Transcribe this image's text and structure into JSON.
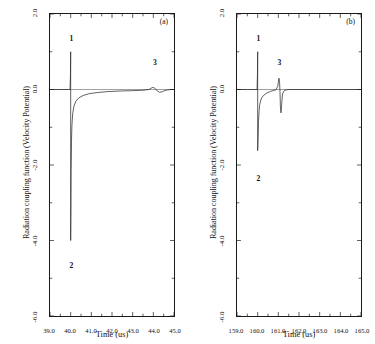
{
  "figure": {
    "ylabel": "Radiation coupling function (Velocity Potential)",
    "xlabel": "Time (us)"
  },
  "panels": [
    {
      "tag": "(a)",
      "xlabel": "Time (us)",
      "xticks": [
        "39.0",
        "40.0",
        "41.0",
        "42.0",
        "43.0",
        "44.0",
        "45.0"
      ],
      "yticks": [
        "2.0",
        "0.0",
        "-2.0",
        "-4.0",
        "-6.0"
      ],
      "annotations": [
        {
          "label": "1",
          "x": 40.02,
          "y": 1.35
        },
        {
          "label": "2",
          "x": 40.02,
          "y": -4.62
        },
        {
          "label": "3",
          "x": 44.0,
          "y": 0.72
        }
      ]
    },
    {
      "tag": "(b)",
      "xlabel": "Time (us)",
      "xticks": [
        "159.0",
        "160.0",
        "161.0",
        "162.0",
        "163.0",
        "164.0",
        "165.0"
      ],
      "yticks": [
        "2.0",
        "0.0",
        "-2.0",
        "-4.0",
        "-6.0"
      ],
      "annotations": [
        {
          "label": "1",
          "x": 160.02,
          "y": 1.35
        },
        {
          "label": "2",
          "x": 160.02,
          "y": -2.35
        },
        {
          "label": "3",
          "x": 161.02,
          "y": 0.72
        }
      ]
    }
  ],
  "chart_data": [
    {
      "type": "line",
      "title": "(a)",
      "xlabel": "Time (us)",
      "ylabel": "Radiation coupling function (Velocity Potential)",
      "xlim": [
        39.0,
        45.0
      ],
      "ylim": [
        -6.0,
        2.0
      ],
      "xticks": [
        39.0,
        40.0,
        41.0,
        42.0,
        43.0,
        44.0,
        45.0
      ],
      "yticks": [
        2.0,
        0.0,
        -2.0,
        -4.0,
        -6.0
      ],
      "grid": false,
      "legend": null,
      "series": [
        {
          "name": "radiation coupling function (a)",
          "x": [
            39.0,
            39.5,
            39.9,
            39.97,
            39.99,
            40.0,
            40.0,
            40.01,
            40.02,
            40.04,
            40.06,
            40.1,
            40.16,
            40.25,
            40.4,
            40.6,
            40.9,
            41.3,
            41.8,
            42.4,
            43.0,
            43.5,
            43.8,
            43.95,
            44.05,
            44.15,
            44.3,
            44.45,
            44.55,
            44.7,
            44.85,
            45.0
          ],
          "y": [
            0.0,
            0.0,
            0.0,
            0.0,
            0.4,
            1.0,
            -4.0,
            -3.4,
            -2.2,
            -1.35,
            -0.95,
            -0.63,
            -0.44,
            -0.31,
            -0.22,
            -0.16,
            -0.11,
            -0.08,
            -0.055,
            -0.04,
            -0.03,
            -0.02,
            0.0,
            0.055,
            0.045,
            -0.02,
            -0.075,
            -0.055,
            -0.03,
            -0.01,
            0.0,
            0.0
          ]
        }
      ],
      "annotations": [
        {
          "text": "1",
          "x": 40.02,
          "y": 1.35
        },
        {
          "text": "2",
          "x": 40.02,
          "y": -4.62
        },
        {
          "text": "3",
          "x": 44.0,
          "y": 0.72
        },
        {
          "text": "(a)",
          "x": 44.6,
          "y": 1.6
        }
      ]
    },
    {
      "type": "line",
      "title": "(b)",
      "xlabel": "Time (us)",
      "ylabel": "Radiation coupling function (Velocity Potential)",
      "xlim": [
        159.0,
        165.0
      ],
      "ylim": [
        -6.0,
        2.0
      ],
      "xticks": [
        159.0,
        160.0,
        161.0,
        162.0,
        163.0,
        164.0,
        165.0
      ],
      "yticks": [
        2.0,
        0.0,
        -2.0,
        -4.0,
        -6.0
      ],
      "grid": false,
      "legend": null,
      "series": [
        {
          "name": "radiation coupling function (b)",
          "x": [
            159.0,
            159.5,
            159.9,
            159.97,
            159.99,
            160.0,
            160.0,
            160.02,
            160.04,
            160.07,
            160.1,
            160.15,
            160.22,
            160.3,
            160.4,
            160.5,
            160.62,
            160.75,
            160.88,
            160.97,
            161.03,
            161.06,
            161.08,
            161.1,
            161.13,
            161.16,
            161.2,
            161.3,
            161.5,
            162.0,
            163.0,
            164.0,
            165.0
          ],
          "y": [
            0.0,
            0.0,
            0.0,
            0.0,
            0.4,
            1.0,
            -1.62,
            -1.3,
            -0.85,
            -0.55,
            -0.4,
            -0.28,
            -0.2,
            -0.15,
            -0.11,
            -0.08,
            -0.05,
            -0.03,
            -0.01,
            0.08,
            0.3,
            0.18,
            -0.05,
            -0.45,
            -0.62,
            -0.4,
            -0.12,
            -0.02,
            0.0,
            0.0,
            0.0,
            0.0,
            0.0
          ]
        }
      ],
      "annotations": [
        {
          "text": "1",
          "x": 160.02,
          "y": 1.35
        },
        {
          "text": "2",
          "x": 160.02,
          "y": -2.35
        },
        {
          "text": "3",
          "x": 161.02,
          "y": 0.72
        },
        {
          "text": "(b)",
          "x": 164.6,
          "y": 1.6
        }
      ]
    }
  ]
}
